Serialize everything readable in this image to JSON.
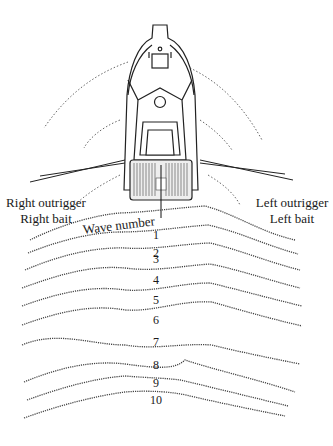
{
  "diagram": {
    "labels": {
      "right_outrigger": "Right outrigger",
      "right_bait": "Right bait",
      "left_outrigger": "Left outrigger",
      "left_bait": "Left bait",
      "wave_title": "Wave number"
    },
    "wave_numbers": [
      "1",
      "2",
      "3",
      "4",
      "5",
      "6",
      "7",
      "8",
      "9",
      "10"
    ],
    "colors": {
      "ink": "#1a1a1a",
      "wake": "#555555",
      "background": "#ffffff"
    }
  }
}
